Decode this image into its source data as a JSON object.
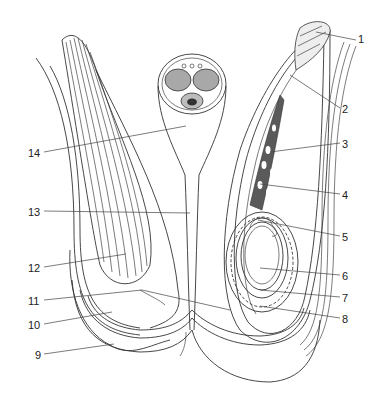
{
  "diagram": {
    "type": "anatomical-cross-section",
    "labels": [
      {
        "id": "1",
        "text": "1",
        "x": 362,
        "y": 34
      },
      {
        "id": "2",
        "text": "2",
        "x": 343,
        "y": 104
      },
      {
        "id": "3",
        "text": "3",
        "x": 343,
        "y": 139
      },
      {
        "id": "4",
        "text": "4",
        "x": 343,
        "y": 190
      },
      {
        "id": "5",
        "text": "5",
        "x": 343,
        "y": 232
      },
      {
        "id": "6",
        "text": "6",
        "x": 343,
        "y": 271
      },
      {
        "id": "7",
        "text": "7",
        "x": 343,
        "y": 293
      },
      {
        "id": "8",
        "text": "8",
        "x": 343,
        "y": 314
      },
      {
        "id": "9",
        "text": "9",
        "x": 35,
        "y": 350
      },
      {
        "id": "10",
        "text": "10",
        "x": 28,
        "y": 320
      },
      {
        "id": "11",
        "text": "11",
        "x": 28,
        "y": 296
      },
      {
        "id": "12",
        "text": "12",
        "x": 28,
        "y": 263
      },
      {
        "id": "13",
        "text": "13",
        "x": 28,
        "y": 207
      },
      {
        "id": "14",
        "text": "14",
        "x": 28,
        "y": 148
      }
    ]
  },
  "colors": {
    "line": "#333333",
    "fill_gray": "#a8a8a8",
    "fill_dark": "#555555",
    "background": "#ffffff"
  }
}
